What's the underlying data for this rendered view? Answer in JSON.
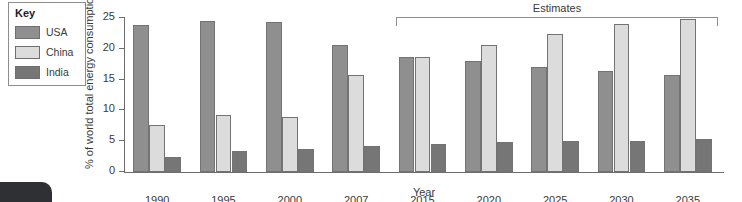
{
  "legend": {
    "title": "Key",
    "items": [
      {
        "label": "USA",
        "color": "#8f8f8f"
      },
      {
        "label": "China",
        "color": "#dcdcdc"
      },
      {
        "label": "India",
        "color": "#767676"
      }
    ]
  },
  "annotation": {
    "estimates_label": "Estimates",
    "estimates_from": "2015"
  },
  "chart_data": {
    "type": "bar",
    "title": "",
    "xlabel": "Year",
    "ylabel": "% of world total energy consumption",
    "ylim": [
      0,
      25
    ],
    "yticks": [
      0,
      5,
      10,
      15,
      20,
      25
    ],
    "ytick_labels": [
      "0",
      "5",
      "10",
      "15",
      "20",
      "25"
    ],
    "grid": false,
    "legend_position": "top-left",
    "categories": [
      "1990",
      "1995",
      "2000",
      "2007",
      "2015",
      "2020",
      "2025",
      "2030",
      "2035"
    ],
    "series": [
      {
        "name": "USA",
        "color": "#8f8f8f",
        "values": [
          23.8,
          24.5,
          24.4,
          20.7,
          18.7,
          18.0,
          17.1,
          16.4,
          15.7
        ]
      },
      {
        "name": "China",
        "color": "#dcdcdc",
        "values": [
          7.6,
          9.2,
          8.9,
          15.7,
          18.6,
          20.7,
          22.4,
          24.0,
          24.8
        ]
      },
      {
        "name": "India",
        "color": "#767676",
        "values": [
          2.4,
          3.4,
          3.7,
          4.2,
          4.5,
          4.9,
          5.1,
          5.1,
          5.4
        ]
      }
    ]
  }
}
